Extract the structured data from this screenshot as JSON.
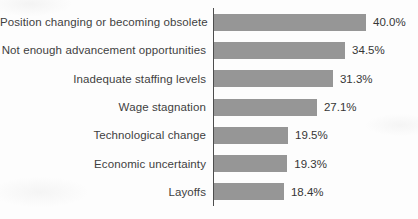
{
  "chart_data": {
    "type": "bar",
    "orientation": "horizontal",
    "title": "",
    "xlabel": "",
    "ylabel": "",
    "grid": false,
    "legend": null,
    "xlim": [
      0,
      42
    ],
    "categories": [
      "Position changing or becoming obsolete",
      "Not enough advancement opportunities",
      "Inadequate staffing levels",
      "Wage stagnation",
      "Technological change",
      "Economic uncertainty",
      "Layoffs"
    ],
    "values": [
      40.0,
      34.5,
      31.3,
      27.1,
      19.5,
      19.3,
      18.4
    ],
    "value_labels": [
      "40.0%",
      "34.5%",
      "31.3%",
      "27.1%",
      "19.5%",
      "19.3%",
      "18.4%"
    ],
    "bar_color": "#969696",
    "axis_color": "#4d4d4d",
    "label_color": "#3f3f3f"
  }
}
